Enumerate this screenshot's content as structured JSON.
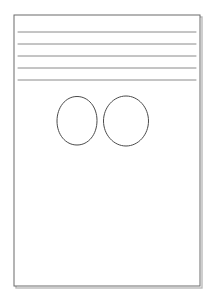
{
  "canvas": {
    "width": 212,
    "height": 304,
    "background_color": "#ffffff",
    "title": "Hand-drawn wireframe sketch of a page"
  },
  "page_frame": {
    "name": "page-outline",
    "label": "Page outline rectangle",
    "x": 14,
    "y": 15,
    "width": 186,
    "height": 271,
    "stroke_color": "#6b6b6b",
    "stroke_width": 1,
    "fill_color": "#ffffff",
    "shadow_color": "#b9b9b9"
  },
  "ruled_lines": {
    "name": "ruled-line-group",
    "label": "Five horizontal ruled lines",
    "count": 5,
    "x_start": 18,
    "x_end": 196,
    "stroke_color": "#8a8a8a",
    "stroke_width": 1,
    "lines": [
      {
        "label": "ruled-line-1",
        "y": 32
      },
      {
        "label": "ruled-line-2",
        "y": 44
      },
      {
        "label": "ruled-line-3",
        "y": 56
      },
      {
        "label": "ruled-line-4",
        "y": 68
      },
      {
        "label": "ruled-line-5",
        "y": 80
      }
    ]
  },
  "circles": {
    "name": "circle-group",
    "label": "Two hand-drawn circles",
    "count": 2,
    "stroke_color": "#4a4a4a",
    "stroke_width": 1,
    "fill_color": "none",
    "items": [
      {
        "label": "circle-left",
        "cx": 77,
        "cy": 121,
        "rx": 20,
        "ry": 24.5,
        "path": "M 77 96.5 C 88.5 96.5 97 107 97 120.5 C 97 134.5 88.5 145 77 145 C 65.5 145 57 134.5 57 121 C 57 107.5 65.5 96.5 77 96.5 Z"
      },
      {
        "label": "circle-right",
        "cx": 126,
        "cy": 121,
        "rx": 22.5,
        "ry": 25,
        "path": "M 126 96 C 138.5 96 148.5 107.5 148.5 121 C 148.5 134.5 138.5 146 126 146 C 113.5 146 103.5 134.5 103.5 121 C 103.5 107.5 113.5 96 126 96 Z"
      }
    ]
  }
}
